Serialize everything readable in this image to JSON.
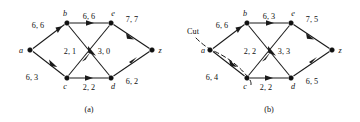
{
  "figure": {
    "background_color": "#ffffff",
    "ink_color": "#111111"
  },
  "panels": [
    {
      "id": "a",
      "caption": "(a)",
      "nodes": [
        {
          "id": "a",
          "label": "a",
          "x": 30,
          "y": 50
        },
        {
          "id": "b",
          "label": "b",
          "x": 67,
          "y": 23
        },
        {
          "id": "c",
          "label": "c",
          "x": 67,
          "y": 78
        },
        {
          "id": "e",
          "label": "e",
          "x": 111,
          "y": 23
        },
        {
          "id": "d",
          "label": "d",
          "x": 111,
          "y": 78
        },
        {
          "id": "z",
          "label": "z",
          "x": 152,
          "y": 50
        }
      ],
      "edges": [
        {
          "from": "a",
          "to": "b",
          "label": "6, 6",
          "label_x": 38,
          "label_y": 28
        },
        {
          "from": "a",
          "to": "c",
          "label": "6, 3",
          "label_x": 32,
          "label_y": 80
        },
        {
          "from": "b",
          "to": "e",
          "label": "6, 6",
          "label_x": 79,
          "label_y": 19
        },
        {
          "from": "b",
          "to": "d",
          "label": "3, 0",
          "label_x": 97,
          "label_y": 54
        },
        {
          "from": "c",
          "to": "e",
          "label": "2, 1",
          "label_x": 62,
          "label_y": 54
        },
        {
          "from": "c",
          "to": "d",
          "label": "2, 2",
          "label_x": 80,
          "label_y": 89
        },
        {
          "from": "e",
          "to": "z",
          "label": "7, 7",
          "label_x": 126,
          "label_y": 22
        },
        {
          "from": "d",
          "to": "z",
          "label": "6, 2",
          "label_x": 126,
          "label_y": 84
        }
      ],
      "cut": null
    },
    {
      "id": "b",
      "caption": "(b)",
      "nodes": [
        {
          "id": "a",
          "label": "a",
          "x": 210,
          "y": 50
        },
        {
          "id": "b",
          "label": "b",
          "x": 247,
          "y": 23
        },
        {
          "id": "c",
          "label": "c",
          "x": 247,
          "y": 78
        },
        {
          "id": "e",
          "label": "e",
          "x": 291,
          "y": 23
        },
        {
          "id": "d",
          "label": "d",
          "x": 291,
          "y": 78
        },
        {
          "id": "z",
          "label": "z",
          "x": 332,
          "y": 50
        }
      ],
      "edges": [
        {
          "from": "a",
          "to": "b",
          "label": "6, 6",
          "label_x": 218,
          "label_y": 28
        },
        {
          "from": "a",
          "to": "c",
          "label": "6, 4",
          "label_x": 212,
          "label_y": 80
        },
        {
          "from": "b",
          "to": "e",
          "label": "6, 3",
          "label_x": 259,
          "label_y": 19
        },
        {
          "from": "b",
          "to": "d",
          "label": "3, 3",
          "label_x": 277,
          "label_y": 54
        },
        {
          "from": "c",
          "to": "e",
          "label": "2, 2",
          "label_x": 242,
          "label_y": 54
        },
        {
          "from": "c",
          "to": "d",
          "label": "2, 2",
          "label_x": 260,
          "label_y": 89
        },
        {
          "from": "e",
          "to": "z",
          "label": "7, 5",
          "label_x": 306,
          "label_y": 22
        },
        {
          "from": "d",
          "to": "z",
          "label": "6, 5",
          "label_x": 306,
          "label_y": 84
        }
      ],
      "cut": {
        "label": "Cut",
        "label_x": 185,
        "label_y": 33
      }
    }
  ]
}
